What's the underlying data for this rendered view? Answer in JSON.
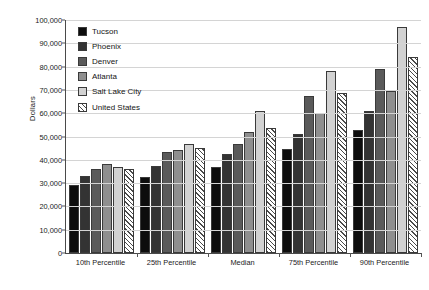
{
  "chart_data": {
    "type": "bar",
    "title": "",
    "xlabel": "",
    "ylabel": "Dollars",
    "ylim": [
      0,
      100000
    ],
    "grid": true,
    "legend_position": "top-left inside plot",
    "categories": [
      "10th Percentile",
      "25th Percentile",
      "Median",
      "75th Percentile",
      "90th Percentile"
    ],
    "ytick_labels": [
      "0",
      "10,000",
      "20,000",
      "30,000",
      "40,000",
      "50,000",
      "60,000",
      "70,000",
      "80,000",
      "90,000",
      "100,000"
    ],
    "ytick_values": [
      0,
      10000,
      20000,
      30000,
      40000,
      50000,
      60000,
      70000,
      80000,
      90000,
      100000
    ],
    "series": [
      {
        "name": "Tucson",
        "color": "#0d0d0d",
        "pattern": "solid",
        "values": [
          29000,
          32500,
          37000,
          44500,
          53000
        ]
      },
      {
        "name": "Phoenix",
        "color": "#333333",
        "pattern": "solid",
        "values": [
          33000,
          37500,
          42500,
          51000,
          61000
        ]
      },
      {
        "name": "Denver",
        "color": "#5a5a5a",
        "pattern": "solid",
        "values": [
          36000,
          43500,
          47000,
          67500,
          79000
        ]
      },
      {
        "name": "Atlanta",
        "color": "#8f8f8f",
        "pattern": "solid",
        "values": [
          38000,
          44000,
          52000,
          60000,
          69500
        ]
      },
      {
        "name": "Salt Lake City",
        "color": "#d2d2d2",
        "pattern": "solid",
        "values": [
          37000,
          47000,
          61000,
          78000,
          97000
        ]
      },
      {
        "name": "United States",
        "color": "#ffffff",
        "pattern": "diagonal-hatch",
        "values": [
          36000,
          45000,
          53500,
          68500,
          84000
        ]
      }
    ]
  }
}
